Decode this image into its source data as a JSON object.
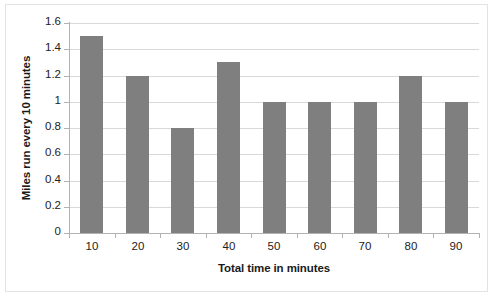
{
  "chart_data": {
    "type": "bar",
    "title": "",
    "xlabel": "Total time in minutes",
    "ylabel": "Miles run every 10 minutes",
    "categories": [
      "10",
      "20",
      "30",
      "40",
      "50",
      "60",
      "70",
      "80",
      "90"
    ],
    "values": [
      1.5,
      1.2,
      0.8,
      1.3,
      1.0,
      1.0,
      1.0,
      1.2,
      1.0
    ],
    "ylim": [
      0,
      1.6
    ],
    "ytick_labels": [
      "0",
      "0.2",
      "0.4",
      "0.6",
      "0.8",
      "1",
      "1.2",
      "1.4",
      "1.6"
    ],
    "ytick_values": [
      0,
      0.2,
      0.4,
      0.6,
      0.8,
      1.0,
      1.2,
      1.4,
      1.6
    ],
    "grid": true,
    "legend": false,
    "legend_position": "none",
    "series": [
      {
        "name": "Miles run every 10 minutes",
        "values": [
          1.5,
          1.2,
          0.8,
          1.3,
          1.0,
          1.0,
          1.0,
          1.2,
          1.0
        ],
        "color": "#7f7f7f"
      }
    ]
  },
  "style": {
    "bar_color": "#7f7f7f",
    "gridline_color": "#d9d9d9",
    "axis_color": "#b2b2b2",
    "border_color": "#e3e3e3",
    "text_color": "#222222",
    "background": "#ffffff"
  }
}
